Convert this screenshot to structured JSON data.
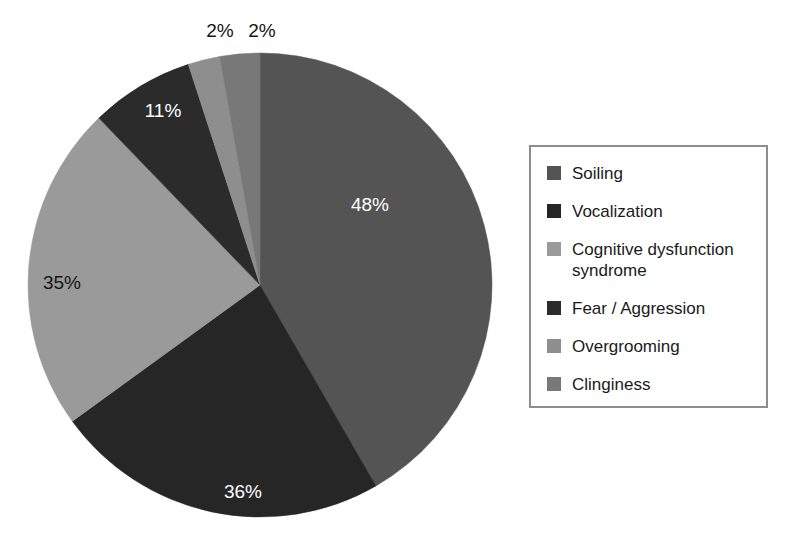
{
  "chart_data": {
    "type": "pie",
    "title": "",
    "legend_position": "right",
    "grid": false,
    "labels_inside": true,
    "categories": [
      "Soiling",
      "Vocalization",
      "Cognitive dysfunction syndrome",
      "Fear / Aggression",
      "Overgrooming",
      "Clinginess"
    ],
    "values": [
      48,
      36,
      35,
      11,
      2,
      2
    ],
    "display_labels": [
      "48%",
      "36%",
      "35%",
      "11%",
      "2%",
      "2%"
    ],
    "colors": [
      "#545454",
      "#262626",
      "#9a9a9a",
      "#2b2b2b",
      "#8e8e8e",
      "#787878"
    ],
    "slices": [
      {
        "name": "Soiling",
        "value": 48,
        "label": "48%",
        "color": "#545454",
        "start_angle": 0,
        "end_angle": 150.0,
        "label_color": "on-dark",
        "label_x": 370,
        "label_y": 211
      },
      {
        "name": "Vocalization",
        "value": 36,
        "label": "36%",
        "color": "#262626",
        "start_angle": 150.0,
        "end_angle": 234.0,
        "label_color": "on-dark",
        "label_x": 243,
        "label_y": 498
      },
      {
        "name": "Cognitive dysfunction syndrome",
        "value": 35,
        "label": "35%",
        "color": "#9a9a9a",
        "start_angle": 234.0,
        "end_angle": 316.0,
        "label_color": "on-light",
        "label_x": 62,
        "label_y": 289
      },
      {
        "name": "Fear / Aggression",
        "value": 11,
        "label": "11%",
        "color": "#2b2b2b",
        "start_angle": 316.0,
        "end_angle": 342.0,
        "label_color": "on-dark",
        "label_x": 163,
        "label_y": 117
      },
      {
        "name": "Overgrooming",
        "value": 2,
        "label": "2%",
        "color": "#8e8e8e",
        "start_angle": 342.0,
        "end_angle": 350.0,
        "label_color": "outside",
        "label_x": 220,
        "label_y": 37
      },
      {
        "name": "Clinginess",
        "value": 2,
        "label": "2%",
        "color": "#787878",
        "start_angle": 350.0,
        "end_angle": 360.0,
        "label_color": "outside",
        "label_x": 262,
        "label_y": 37
      }
    ],
    "geometry": {
      "center_x": 260,
      "center_y": 285,
      "radius": 232
    }
  },
  "legend": {
    "items": [
      {
        "label": "Soiling",
        "color": "#545454"
      },
      {
        "label": "Vocalization",
        "color": "#262626"
      },
      {
        "label": "Cognitive dysfunction\nsyndrome",
        "color": "#9a9a9a"
      },
      {
        "label": "Fear / Aggression",
        "color": "#2b2b2b"
      },
      {
        "label": "Overgrooming",
        "color": "#8e8e8e"
      },
      {
        "label": "Clinginess",
        "color": "#787878"
      }
    ]
  }
}
